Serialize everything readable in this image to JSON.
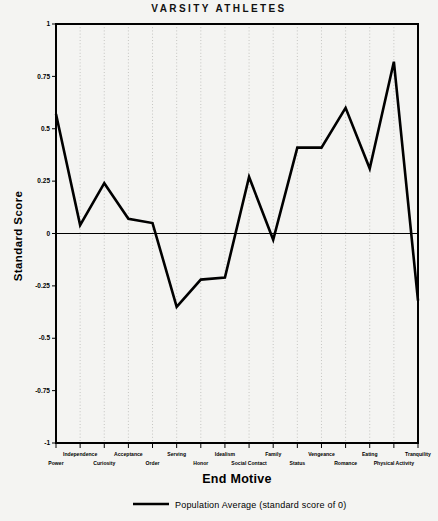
{
  "chart_data": {
    "type": "line",
    "title": "VARSITY ATHLETES",
    "xlabel": "End Motive",
    "ylabel": "Standard Score",
    "ylim": [
      -1,
      1
    ],
    "yticks": [
      "1",
      "0.75",
      "0.5",
      "0.25",
      "0",
      "-0.25",
      "-0.5",
      "-0.75",
      "-1"
    ],
    "ytick_values": [
      1,
      0.75,
      0.5,
      0.25,
      0,
      -0.25,
      -0.5,
      -0.75,
      -1
    ],
    "grid": "vertical-dotted",
    "legend_position": "below-axis",
    "categories": [
      "Power",
      "Independence",
      "Curiosity",
      "Acceptance",
      "Order",
      "Serving",
      "Honor",
      "Idealism",
      "Social Contact",
      "Family",
      "Status",
      "Vengeance",
      "Romance",
      "Eating",
      "Physical Activity",
      "Tranquility"
    ],
    "values": [
      0.57,
      0.04,
      0.24,
      0.07,
      0.05,
      -0.35,
      -0.22,
      -0.21,
      0.27,
      -0.03,
      0.41,
      0.41,
      0.6,
      0.31,
      0.82,
      -0.32
    ],
    "series": [
      {
        "name": "Varsity Athletes",
        "values": [
          0.57,
          0.04,
          0.24,
          0.07,
          0.05,
          -0.35,
          -0.22,
          -0.21,
          0.27,
          -0.03,
          0.41,
          0.41,
          0.6,
          0.31,
          0.82,
          -0.32
        ]
      }
    ],
    "reference_line": {
      "value": 0,
      "label": "Population Average (standard score of 0)"
    },
    "colors": {
      "line": "#000000",
      "background": "#f4f4f2",
      "axis": "#000000",
      "grid": "#b9b9b5"
    }
  },
  "legend": {
    "label": "Population Average (standard score of 0)"
  }
}
